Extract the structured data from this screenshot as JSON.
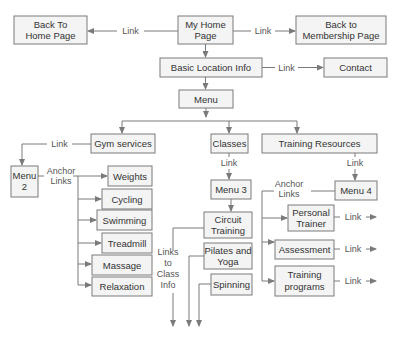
{
  "nodes": {
    "back_home": [
      "Back To",
      "Home Page"
    ],
    "my_home": [
      "My Home",
      "Page"
    ],
    "back_membership": [
      "Back to",
      "Membership Page"
    ],
    "basic_location": "Basic Location Info",
    "contact": "Contact",
    "menu": "Menu",
    "gym_services": "Gym services",
    "classes": "Classes",
    "training_resources": "Training Resources",
    "menu2": [
      "Menu",
      "2"
    ],
    "weights": "Weights",
    "cycling": "Cycling",
    "swimming": "Swimming",
    "treadmill": "Treadmill",
    "massage": "Massage",
    "relaxation": "Relaxation",
    "menu3": "Menu 3",
    "circuit_training": [
      "Circuit",
      "Training"
    ],
    "pilates_yoga": [
      "Pilates and",
      "Yoga"
    ],
    "spinning": "Spinning",
    "menu4": "Menu 4",
    "personal_trainer": [
      "Personal",
      "Trainer"
    ],
    "assessment": "Assessment",
    "training_programs": [
      "Training",
      "programs"
    ]
  },
  "edge_labels": {
    "link": "Link",
    "anchor_links": [
      "Anchor",
      "Links"
    ],
    "links_to_class_info": [
      "Links",
      "to",
      "Class",
      "Info"
    ]
  }
}
